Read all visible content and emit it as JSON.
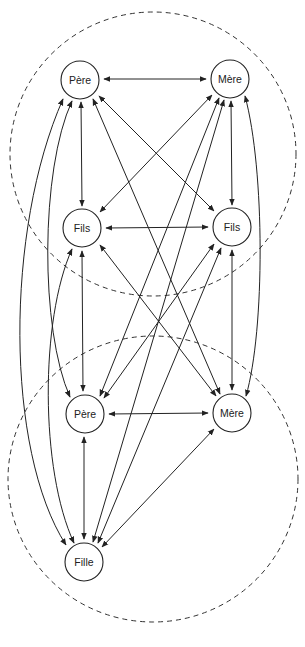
{
  "diagram": {
    "colors": {
      "stroke": "#222222",
      "background": "#ffffff",
      "boundary": "#333333"
    },
    "groups": [
      {
        "id": "family_of_origin",
        "shape": "dashed-ellipse",
        "cx": 153,
        "cy": 154,
        "rx": 143,
        "ry": 142
      },
      {
        "id": "family_of_procreation",
        "shape": "dashed-ellipse",
        "cx": 153,
        "cy": 479,
        "rx": 145,
        "ry": 143
      }
    ],
    "nodes": [
      {
        "id": "pere1",
        "label": "Père",
        "x": 80,
        "y": 80
      },
      {
        "id": "mere1",
        "label": "Mère",
        "x": 230,
        "y": 79
      },
      {
        "id": "fils1",
        "label": "Fils",
        "x": 82,
        "y": 228
      },
      {
        "id": "fils2",
        "label": "Fils",
        "x": 232,
        "y": 227
      },
      {
        "id": "pere2",
        "label": "Père",
        "x": 85,
        "y": 414
      },
      {
        "id": "mere2",
        "label": "Mère",
        "x": 232,
        "y": 413
      },
      {
        "id": "fille",
        "label": "Fille",
        "x": 84,
        "y": 562
      }
    ],
    "edges": [
      {
        "from": "pere1",
        "to": "mere1",
        "type": "bidirectional"
      },
      {
        "from": "pere1",
        "to": "fils1",
        "type": "bidirectional"
      },
      {
        "from": "pere1",
        "to": "fils2",
        "type": "bidirectional"
      },
      {
        "from": "pere1",
        "to": "mere2",
        "type": "bidirectional"
      },
      {
        "from": "pere1",
        "to": "pere2",
        "type": "bidirectional",
        "curved": true
      },
      {
        "from": "pere1",
        "to": "fille",
        "type": "bidirectional",
        "curved": true
      },
      {
        "from": "mere1",
        "to": "fils1",
        "type": "bidirectional"
      },
      {
        "from": "mere1",
        "to": "fils2",
        "type": "bidirectional"
      },
      {
        "from": "mere1",
        "to": "pere2",
        "type": "bidirectional"
      },
      {
        "from": "mere1",
        "to": "fille",
        "type": "bidirectional"
      },
      {
        "from": "mere1",
        "to": "mere2",
        "type": "bidirectional",
        "curved": true
      },
      {
        "from": "fils1",
        "to": "fils2",
        "type": "bidirectional"
      },
      {
        "from": "fils1",
        "to": "pere2",
        "type": "bidirectional"
      },
      {
        "from": "fils1",
        "to": "mere2",
        "type": "bidirectional"
      },
      {
        "from": "fils1",
        "to": "fille",
        "type": "bidirectional",
        "curved": true
      },
      {
        "from": "fils2",
        "to": "pere2",
        "type": "bidirectional"
      },
      {
        "from": "fils2",
        "to": "mere2",
        "type": "bidirectional"
      },
      {
        "from": "fils2",
        "to": "fille",
        "type": "bidirectional"
      },
      {
        "from": "pere2",
        "to": "mere2",
        "type": "bidirectional"
      },
      {
        "from": "pere2",
        "to": "fille",
        "type": "bidirectional"
      },
      {
        "from": "mere2",
        "to": "fille",
        "type": "bidirectional"
      }
    ]
  }
}
